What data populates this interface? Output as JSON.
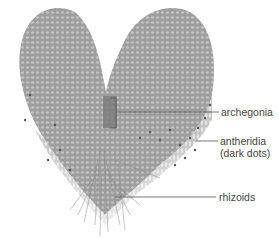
{
  "figure": {
    "labels": [
      {
        "id": "archegonia",
        "text": "archegonia"
      },
      {
        "id": "antheridia",
        "line1": "antheridia",
        "line2": "(dark dots)"
      },
      {
        "id": "rhizoids",
        "text": "rhizoids"
      }
    ],
    "colors": {
      "thallus": "#a9a9a9",
      "thallus_dark": "#7a7a7a",
      "leader": "#555555",
      "text": "#444444"
    }
  }
}
